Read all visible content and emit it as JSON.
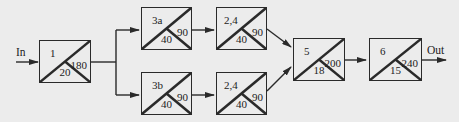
{
  "diagram": {
    "type": "block-flow",
    "input_label": "In",
    "output_label": "Out",
    "colors": {
      "background": "#ececec",
      "stroke": "#2a2a2a",
      "text": "#222222"
    },
    "blocks": [
      {
        "id": "1",
        "top_left": "1",
        "right": "180",
        "bottom": "20"
      },
      {
        "id": "3a",
        "top_left": "3a",
        "right": "90",
        "bottom": "40"
      },
      {
        "id": "24a",
        "top_left": "2,4",
        "right": "90",
        "bottom": "40"
      },
      {
        "id": "3b",
        "top_left": "3b",
        "right": "90",
        "bottom": "40"
      },
      {
        "id": "24b",
        "top_left": "2,4",
        "right": "90",
        "bottom": "40"
      },
      {
        "id": "5",
        "top_left": "5",
        "right": "200",
        "bottom": "18"
      },
      {
        "id": "6",
        "top_left": "6",
        "right": "240",
        "bottom": "15"
      }
    ],
    "edges": [
      [
        "In",
        "1"
      ],
      [
        "1",
        "3a"
      ],
      [
        "1",
        "3b"
      ],
      [
        "3a",
        "24a"
      ],
      [
        "3b",
        "24b"
      ],
      [
        "24a",
        "5"
      ],
      [
        "24b",
        "5"
      ],
      [
        "5",
        "6"
      ],
      [
        "6",
        "Out"
      ]
    ]
  }
}
